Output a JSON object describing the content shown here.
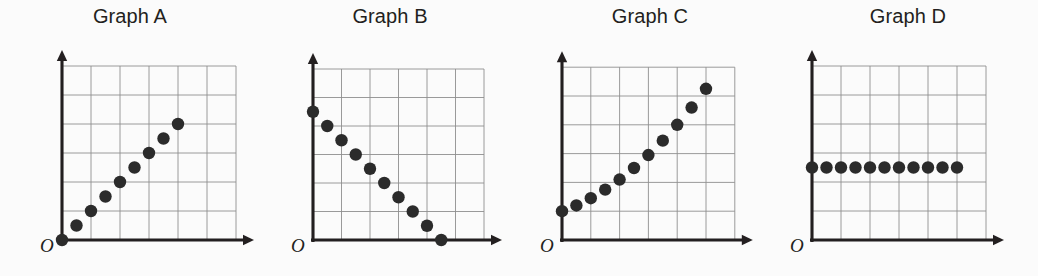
{
  "figure": {
    "background_color": "#fbfbfb",
    "ink_color": "#231f20",
    "grid_color": "#8e8e8e",
    "point_color": "#2b2b2b",
    "point_radius": 6.2,
    "origin_label": "O"
  },
  "panels": [
    {
      "id": "graph-a",
      "title": "Graph A",
      "origin_label": "O",
      "grid": {
        "cols": 6,
        "rows": 6
      },
      "x_axis_label": "",
      "y_axis_label": ""
    },
    {
      "id": "graph-b",
      "title": "Graph B",
      "origin_label": "O",
      "grid": {
        "cols": 6,
        "rows": 6
      },
      "x_axis_label": "",
      "y_axis_label": ""
    },
    {
      "id": "graph-c",
      "title": "Graph C",
      "origin_label": "O",
      "grid": {
        "cols": 6,
        "rows": 6
      },
      "x_axis_label": "",
      "y_axis_label": ""
    },
    {
      "id": "graph-d",
      "title": "Graph D",
      "origin_label": "O",
      "grid": {
        "cols": 6,
        "rows": 6
      },
      "x_axis_label": "",
      "y_axis_label": ""
    }
  ],
  "chart_data": [
    {
      "type": "scatter",
      "title": "Graph A",
      "xlabel": "",
      "ylabel": "",
      "xlim": [
        0,
        6
      ],
      "ylim": [
        0,
        6
      ],
      "grid": true,
      "legend": "none",
      "relationship": "linear increasing (positive proportional)",
      "x": [
        0,
        0.5,
        1.0,
        1.5,
        2.0,
        2.5,
        3.0,
        3.5,
        4.0
      ],
      "y": [
        0,
        0.5,
        1.0,
        1.5,
        2.0,
        2.5,
        3.0,
        3.5,
        4.0
      ]
    },
    {
      "type": "scatter",
      "title": "Graph B",
      "xlabel": "",
      "ylabel": "",
      "xlim": [
        0,
        6
      ],
      "ylim": [
        0,
        6
      ],
      "grid": true,
      "legend": "none",
      "relationship": "linear decreasing (negative)",
      "x": [
        0,
        0.5,
        1.0,
        1.5,
        2.0,
        2.5,
        3.0,
        3.5,
        4.0,
        4.5
      ],
      "y": [
        4.5,
        4.0,
        3.5,
        3.0,
        2.5,
        2.0,
        1.5,
        1.0,
        0.5,
        0
      ]
    },
    {
      "type": "scatter",
      "title": "Graph C",
      "xlabel": "",
      "ylabel": "",
      "xlim": [
        0,
        6
      ],
      "ylim": [
        0,
        6
      ],
      "grid": true,
      "legend": "none",
      "relationship": "increasing curve (accelerating / non-linear)",
      "x": [
        0,
        0.5,
        1.0,
        1.5,
        2.0,
        2.5,
        3.0,
        3.5,
        4.0,
        4.5,
        5.0
      ],
      "y": [
        1.0,
        1.2,
        1.45,
        1.75,
        2.1,
        2.5,
        2.95,
        3.45,
        4.0,
        4.6,
        5.25
      ]
    },
    {
      "type": "scatter",
      "title": "Graph D",
      "xlabel": "",
      "ylabel": "",
      "xlim": [
        0,
        6
      ],
      "ylim": [
        0,
        6
      ],
      "grid": true,
      "legend": "none",
      "relationship": "constant (no change)",
      "x": [
        0,
        0.5,
        1.0,
        1.5,
        2.0,
        2.5,
        3.0,
        3.5,
        4.0,
        4.5,
        5.0
      ],
      "y": [
        2.5,
        2.5,
        2.5,
        2.5,
        2.5,
        2.5,
        2.5,
        2.5,
        2.5,
        2.5,
        2.5
      ]
    }
  ]
}
